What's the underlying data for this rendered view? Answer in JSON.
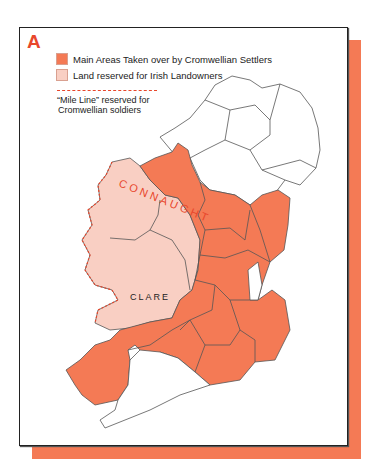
{
  "panel_letter": "A",
  "legend": {
    "items": [
      {
        "label": "Main Areas Taken over by Cromwellian Settlers",
        "color": "#f47a55"
      },
      {
        "label": "Land reserved for Irish Landowners",
        "color": "#f9cfc3"
      }
    ],
    "mile_line": {
      "line1": "“Mile Line” reserved for",
      "line2": "Cromwellian soldiers",
      "color": "#e8472c"
    }
  },
  "map": {
    "labels": {
      "connaught": "CONNAUGHT",
      "clare": "CLARE"
    },
    "colors": {
      "settlers": "#f47a55",
      "irish": "#f9cfc3",
      "unaffected": "#ffffff",
      "frame_shadow": "#f47a55"
    }
  }
}
